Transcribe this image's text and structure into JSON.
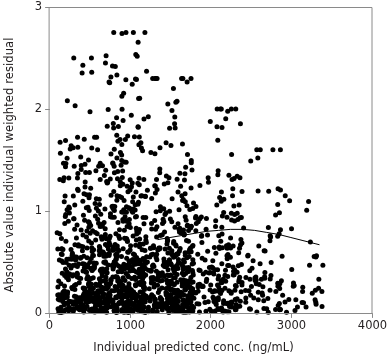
{
  "chart_data": {
    "type": "scatter",
    "title": "",
    "xlabel": "Individual predicted conc. (ng/mL)",
    "ylabel": "Absolute value individual weighted residual",
    "xlim": [
      0,
      4000
    ],
    "ylim": [
      0,
      3
    ],
    "xticks": [
      0,
      1000,
      2000,
      3000,
      4000
    ],
    "xtick_labels": [
      "0",
      "1000",
      "2000",
      "3000",
      "4000"
    ],
    "yticks": [
      0,
      1,
      2,
      3
    ],
    "ytick_labels": [
      "0",
      "1",
      "2",
      "3"
    ],
    "grid": false,
    "legend": null,
    "marker": {
      "shape": "circle",
      "color": "#000000",
      "size_px": 5,
      "count_approx": 1600
    },
    "frame": {
      "color": "#8a8a8a",
      "sides": [
        "left",
        "right",
        "top",
        "bottom"
      ]
    },
    "series": [
      {
        "name": "Absolute weighted residuals",
        "type": "scatter",
        "note": "Dense cloud concentrated at low predicted concentrations; density falls off sharply above 2000 ng/mL and above residual 1.5."
      },
      {
        "name": "LOESS smooth",
        "type": "line",
        "color": "#000000",
        "width_px": 1,
        "x": [
          1350,
          1500,
          1650,
          1800,
          1950,
          2100,
          2250,
          2400,
          2550,
          2700,
          2850,
          3000,
          3150,
          3300,
          3350
        ],
        "y": [
          0.72,
          0.74,
          0.76,
          0.78,
          0.8,
          0.81,
          0.82,
          0.82,
          0.81,
          0.79,
          0.77,
          0.74,
          0.71,
          0.68,
          0.67
        ]
      }
    ],
    "density_profile": [
      {
        "x_range": [
          100,
          600
        ],
        "weight": 0.2,
        "y_decay": 0.55,
        "y_max": 2.5
      },
      {
        "x_range": [
          600,
          1200
        ],
        "weight": 0.34,
        "y_decay": 0.6,
        "y_max": 2.75
      },
      {
        "x_range": [
          1200,
          1800
        ],
        "weight": 0.26,
        "y_decay": 0.55,
        "y_max": 2.3
      },
      {
        "x_range": [
          1800,
          2400
        ],
        "weight": 0.13,
        "y_decay": 0.5,
        "y_max": 2.0
      },
      {
        "x_range": [
          2400,
          2900
        ],
        "weight": 0.05,
        "y_decay": 0.45,
        "y_max": 1.6
      },
      {
        "x_range": [
          2900,
          3400
        ],
        "weight": 0.02,
        "y_decay": 0.4,
        "y_max": 1.1
      }
    ],
    "notable_points": [
      {
        "x": 905,
        "y": 2.74
      },
      {
        "x": 420,
        "y": 2.43
      },
      {
        "x": 700,
        "y": 2.45
      },
      {
        "x": 530,
        "y": 2.36
      },
      {
        "x": 1210,
        "y": 2.37
      },
      {
        "x": 1085,
        "y": 2.29
      },
      {
        "x": 205,
        "y": 1.69
      },
      {
        "x": 2590,
        "y": 1.52
      },
      {
        "x": 2930,
        "y": 1.15
      },
      {
        "x": 3310,
        "y": 0.55
      },
      {
        "x": 3300,
        "y": 0.13
      }
    ]
  }
}
